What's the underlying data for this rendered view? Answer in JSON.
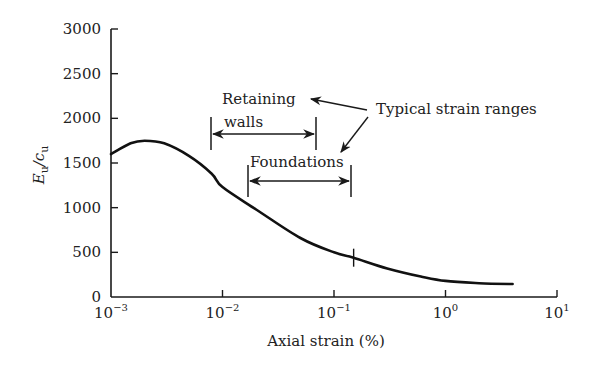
{
  "chart_data": {
    "type": "line",
    "title": "",
    "xlabel": "Axial strain (%)",
    "ylabel": "Eu/cu",
    "ylabel_main": "E",
    "ylabel_sub1": "u",
    "ylabel_slash": "/c",
    "ylabel_sub2": "u",
    "xscale": "log",
    "xlim": [
      0.001,
      10
    ],
    "ylim": [
      0,
      3000
    ],
    "grid": false,
    "legend": null,
    "x_ticks": [
      {
        "value": 0.001,
        "base": "10",
        "exp": "−3"
      },
      {
        "value": 0.01,
        "base": "10",
        "exp": "−2"
      },
      {
        "value": 0.1,
        "base": "10",
        "exp": "−1"
      },
      {
        "value": 1,
        "base": "10",
        "exp": "0"
      },
      {
        "value": 10,
        "base": "10",
        "exp": "1"
      }
    ],
    "y_ticks": [
      0,
      500,
      1000,
      1500,
      2000,
      2500,
      3000
    ],
    "y_tick_labels": [
      "0",
      "500",
      "1000",
      "1500",
      "2000",
      "2500",
      "3000"
    ],
    "series": [
      {
        "name": "Eu/cu",
        "x": [
          0.001,
          0.0015,
          0.002,
          0.003,
          0.005,
          0.008,
          0.01,
          0.02,
          0.05,
          0.1,
          0.15,
          0.3,
          0.6,
          1.0,
          2.0,
          4.0
        ],
        "y": [
          1600,
          1720,
          1750,
          1720,
          1580,
          1380,
          1230,
          980,
          660,
          500,
          440,
          320,
          230,
          180,
          155,
          145
        ]
      }
    ],
    "annotations": [
      {
        "type": "range",
        "label_line1": "Retaining",
        "label_line2": "walls",
        "x_start": 0.008,
        "x_end": 0.07
      },
      {
        "type": "range",
        "label_line1": "Foundations",
        "x_start": 0.017,
        "x_end": 0.15
      },
      {
        "type": "text",
        "label": "Typical strain ranges",
        "arrows_to": [
          "Retaining walls",
          "Foundations"
        ]
      },
      {
        "type": "marker",
        "description": "tick on curve",
        "x": 0.15,
        "y": 440
      }
    ]
  }
}
